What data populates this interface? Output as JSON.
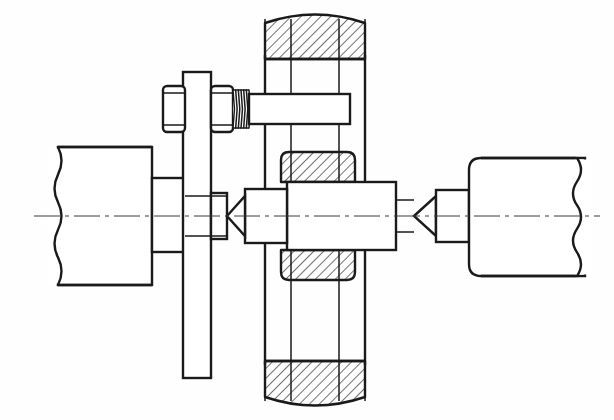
{
  "drawing": {
    "title": "Mechanical assembly cross-section",
    "description": "Engineering section view of a shaft held between centers inside a yoke frame with bolt and hex nuts",
    "canvas": {
      "width": 614,
      "height": 420,
      "background": "#fefefe"
    },
    "style": {
      "line_color": "#1a1a1a",
      "hatch_color": "#1a1a1a",
      "centerline_color": "#3a3a3a",
      "thick_stroke": 2.4,
      "thin_stroke": 1.5,
      "hair_stroke": 1.0,
      "hatch_angle_deg": 45,
      "hatch_spacing": 7
    },
    "centerline": {
      "label": "horizontal-axis-centerline",
      "y": 216,
      "x_start": 34,
      "x_end": 600,
      "dash_pattern": "26 5 4 5"
    },
    "parts": [
      {
        "id": "left-workpiece",
        "name": "left-end-block",
        "kind": "broken-block",
        "x": 58,
        "y": 147,
        "width": 94,
        "height": 138,
        "break_side": "left",
        "hatched": false
      },
      {
        "id": "left-shaft-stub",
        "name": "left-shaft-stub",
        "kind": "rect",
        "x": 152,
        "y": 178,
        "width": 33,
        "height": 74,
        "hatched": false
      },
      {
        "id": "vertical-plate",
        "name": "vertical-support-plate",
        "kind": "rect",
        "x": 183,
        "y": 72,
        "width": 28,
        "height": 306,
        "hatched": false
      },
      {
        "id": "plate-boss",
        "name": "plate-boss",
        "kind": "rect",
        "x": 211,
        "y": 193,
        "width": 16,
        "height": 46,
        "hatched": false
      },
      {
        "id": "nut-left",
        "name": "hex-nut-left",
        "kind": "hex-nut",
        "x": 163,
        "y": 86,
        "width": 22,
        "height": 46
      },
      {
        "id": "nut-right",
        "name": "hex-nut-right",
        "kind": "hex-nut",
        "x": 211,
        "y": 86,
        "width": 22,
        "height": 46
      },
      {
        "id": "threaded-rod",
        "name": "threaded-rod-section",
        "kind": "thread",
        "x": 233,
        "y": 90,
        "width": 16,
        "height": 38,
        "turns": 6
      },
      {
        "id": "cross-bar",
        "name": "horizontal-cross-bar",
        "kind": "rect",
        "x": 249,
        "y": 94,
        "width": 101,
        "height": 30,
        "hatched": false
      },
      {
        "id": "yoke-top",
        "name": "yoke-top-cap",
        "kind": "hatched-cap",
        "x": 265,
        "y": 13,
        "width": 100,
        "height": 46,
        "orientation": "top"
      },
      {
        "id": "yoke-bottom",
        "name": "yoke-bottom-cap",
        "kind": "hatched-cap",
        "x": 265,
        "y": 361,
        "width": 100,
        "height": 46,
        "orientation": "bottom"
      },
      {
        "id": "yoke-left-rail",
        "name": "yoke-left-rail",
        "kind": "vline-pair",
        "x1": 265,
        "x2": 291,
        "y_top": 13,
        "y_bottom": 407
      },
      {
        "id": "yoke-right-rail",
        "name": "yoke-right-rail",
        "kind": "vline-pair",
        "x1": 339,
        "x2": 365,
        "y_top": 13,
        "y_bottom": 407
      },
      {
        "id": "bearing-collar-top",
        "name": "bearing-collar-top",
        "kind": "hatched-collar",
        "x": 281,
        "y": 152,
        "width": 74,
        "height": 30,
        "orientation": "top"
      },
      {
        "id": "bearing-collar-bottom",
        "name": "bearing-collar-bottom",
        "kind": "hatched-collar",
        "x": 281,
        "y": 250,
        "width": 74,
        "height": 30,
        "orientation": "bottom"
      },
      {
        "id": "hub-body",
        "name": "central-hub-body",
        "kind": "rect",
        "x": 287,
        "y": 182,
        "width": 109,
        "height": 68,
        "hatched": false
      },
      {
        "id": "hub-left-collar",
        "name": "hub-left-collar",
        "kind": "rect",
        "x": 245,
        "y": 189,
        "width": 42,
        "height": 54,
        "hatched": false
      },
      {
        "id": "center-point-left",
        "name": "left-center-point",
        "kind": "cone",
        "apex_x": 227,
        "base_x": 245,
        "y_top": 196,
        "y_bottom": 236,
        "direction": "left"
      },
      {
        "id": "center-point-right",
        "name": "right-center-point",
        "kind": "cone",
        "apex_x": 414,
        "base_x": 436,
        "y_top": 196,
        "y_bottom": 236,
        "direction": "right"
      },
      {
        "id": "right-shaft-collar",
        "name": "right-shaft-collar",
        "kind": "rect",
        "x": 436,
        "y": 190,
        "width": 33,
        "height": 52,
        "hatched": false
      },
      {
        "id": "right-workpiece",
        "name": "right-end-block",
        "kind": "broken-block",
        "x": 469,
        "y": 158,
        "width": 116,
        "height": 118,
        "break_side": "right",
        "hatched": false
      }
    ],
    "annotations": {
      "section_hatching": "45-degree parallel line hatching indicating cut material",
      "break_lines": "freehand wavy lines indicating truncated length",
      "thread_symbol": "zig-zag profile representing external screw thread"
    }
  }
}
